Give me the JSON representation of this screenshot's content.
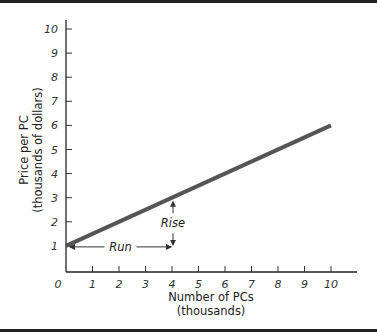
{
  "chart_data": {
    "type": "line",
    "title": "",
    "xlabel": "Number of PCs",
    "xlabel_sub": "(thousands)",
    "ylabel": "Price per PC",
    "ylabel_sub": "(thousands of dollars)",
    "xlim": [
      0,
      10
    ],
    "ylim": [
      0,
      10
    ],
    "x_ticks": [
      "0",
      "1",
      "2",
      "3",
      "4",
      "5",
      "6",
      "7",
      "8",
      "9",
      "10"
    ],
    "y_ticks": [
      "1",
      "2",
      "3",
      "4",
      "5",
      "6",
      "7",
      "8",
      "9",
      "10"
    ],
    "grid": false,
    "series": [
      {
        "name": "Price line",
        "x": [
          0,
          10
        ],
        "y": [
          1,
          6
        ],
        "color": "#555555"
      }
    ],
    "annotations": [
      {
        "text": "Run",
        "from": [
          0,
          1
        ],
        "to": [
          4,
          1
        ],
        "type": "horizontal-arrow"
      },
      {
        "text": "Rise",
        "from": [
          4,
          1
        ],
        "to": [
          4,
          3
        ],
        "type": "vertical-arrow"
      }
    ]
  }
}
